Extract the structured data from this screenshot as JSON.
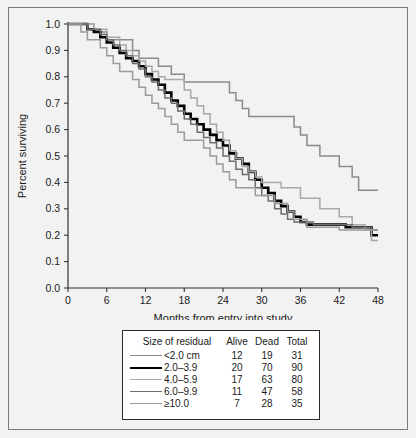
{
  "chart_data": {
    "type": "line",
    "title": "",
    "xlabel": "Months from entry into study",
    "ylabel": "Percent surviving",
    "xlim": [
      0,
      48
    ],
    "ylim": [
      0.0,
      1.0
    ],
    "xticks": [
      0,
      6,
      12,
      18,
      24,
      30,
      36,
      42,
      48
    ],
    "xtick_labels": [
      "0",
      "6",
      "12",
      "18",
      "24",
      "30",
      "36",
      "42",
      "48"
    ],
    "yticks": [
      0.0,
      0.1,
      0.2,
      0.3,
      0.4,
      0.5,
      0.6,
      0.7,
      0.8,
      0.9,
      1.0
    ],
    "ytick_labels": [
      "0.0",
      "0.1",
      "0.2",
      "0.3",
      "0.4",
      "0.5",
      "0.6",
      "0.7",
      "0.8",
      "0.9",
      "1.0"
    ],
    "grid": false,
    "legend_position": "below-plot",
    "step_style": "post",
    "series": [
      {
        "name": "<2.0 cm",
        "color": "#8a8a8a",
        "width": 1.5,
        "points": [
          [
            0,
            1.0
          ],
          [
            2,
            1.0
          ],
          [
            4,
            0.97
          ],
          [
            6,
            0.94
          ],
          [
            8,
            0.94
          ],
          [
            10,
            0.9
          ],
          [
            11,
            0.87
          ],
          [
            13,
            0.87
          ],
          [
            14,
            0.84
          ],
          [
            16,
            0.81
          ],
          [
            17,
            0.81
          ],
          [
            18,
            0.78
          ],
          [
            22,
            0.78
          ],
          [
            24,
            0.78
          ],
          [
            25,
            0.74
          ],
          [
            26,
            0.71
          ],
          [
            27,
            0.68
          ],
          [
            28,
            0.65
          ],
          [
            34,
            0.65
          ],
          [
            35,
            0.61
          ],
          [
            36,
            0.58
          ],
          [
            37,
            0.54
          ],
          [
            38,
            0.54
          ],
          [
            39,
            0.5
          ],
          [
            41,
            0.5
          ],
          [
            42,
            0.46
          ],
          [
            43,
            0.46
          ],
          [
            44,
            0.42
          ],
          [
            45,
            0.37
          ],
          [
            48,
            0.37
          ]
        ]
      },
      {
        "name": "2.0–3.9",
        "color": "#000000",
        "width": 2.6,
        "points": [
          [
            0,
            1.0
          ],
          [
            2,
            1.0
          ],
          [
            3,
            0.98
          ],
          [
            4,
            0.97
          ],
          [
            5,
            0.95
          ],
          [
            6,
            0.93
          ],
          [
            7,
            0.91
          ],
          [
            8,
            0.89
          ],
          [
            9,
            0.87
          ],
          [
            10,
            0.86
          ],
          [
            11,
            0.84
          ],
          [
            12,
            0.81
          ],
          [
            13,
            0.79
          ],
          [
            14,
            0.77
          ],
          [
            15,
            0.74
          ],
          [
            16,
            0.71
          ],
          [
            17,
            0.69
          ],
          [
            18,
            0.66
          ],
          [
            19,
            0.64
          ],
          [
            20,
            0.62
          ],
          [
            21,
            0.6
          ],
          [
            22,
            0.58
          ],
          [
            23,
            0.56
          ],
          [
            24,
            0.54
          ],
          [
            25,
            0.51
          ],
          [
            26,
            0.49
          ],
          [
            27,
            0.47
          ],
          [
            28,
            0.44
          ],
          [
            29,
            0.41
          ],
          [
            30,
            0.38
          ],
          [
            31,
            0.36
          ],
          [
            32,
            0.33
          ],
          [
            33,
            0.31
          ],
          [
            34,
            0.29
          ],
          [
            35,
            0.27
          ],
          [
            36,
            0.25
          ],
          [
            37,
            0.24
          ],
          [
            40,
            0.24
          ],
          [
            43,
            0.23
          ],
          [
            46,
            0.23
          ],
          [
            47,
            0.2
          ],
          [
            48,
            0.2
          ]
        ]
      },
      {
        "name": "4.0–5.9",
        "color": "#a8a8a8",
        "width": 1.5,
        "points": [
          [
            0,
            1.0
          ],
          [
            2,
            1.0
          ],
          [
            4,
            0.98
          ],
          [
            6,
            0.95
          ],
          [
            8,
            0.92
          ],
          [
            9,
            0.9
          ],
          [
            10,
            0.88
          ],
          [
            11,
            0.86
          ],
          [
            12,
            0.84
          ],
          [
            13,
            0.82
          ],
          [
            14,
            0.8
          ],
          [
            15,
            0.79
          ],
          [
            17,
            0.79
          ],
          [
            18,
            0.75
          ],
          [
            19,
            0.72
          ],
          [
            20,
            0.69
          ],
          [
            21,
            0.66
          ],
          [
            22,
            0.62
          ],
          [
            23,
            0.59
          ],
          [
            24,
            0.56
          ],
          [
            25,
            0.52
          ],
          [
            26,
            0.49
          ],
          [
            27,
            0.46
          ],
          [
            28,
            0.44
          ],
          [
            29,
            0.42
          ],
          [
            30,
            0.4
          ],
          [
            32,
            0.4
          ],
          [
            33,
            0.38
          ],
          [
            35,
            0.38
          ],
          [
            36,
            0.34
          ],
          [
            38,
            0.34
          ],
          [
            39,
            0.3
          ],
          [
            41,
            0.3
          ],
          [
            42,
            0.27
          ],
          [
            44,
            0.24
          ],
          [
            46,
            0.22
          ],
          [
            47,
            0.18
          ],
          [
            48,
            0.18
          ]
        ]
      },
      {
        "name": "6.0–9.9",
        "color": "#6e6e6e",
        "width": 1.5,
        "points": [
          [
            0,
            1.0
          ],
          [
            2,
            1.0
          ],
          [
            3,
            0.98
          ],
          [
            5,
            0.96
          ],
          [
            6,
            0.94
          ],
          [
            7,
            0.92
          ],
          [
            8,
            0.9
          ],
          [
            9,
            0.88
          ],
          [
            10,
            0.85
          ],
          [
            11,
            0.83
          ],
          [
            12,
            0.8
          ],
          [
            13,
            0.78
          ],
          [
            14,
            0.75
          ],
          [
            15,
            0.72
          ],
          [
            16,
            0.7
          ],
          [
            17,
            0.67
          ],
          [
            18,
            0.64
          ],
          [
            19,
            0.62
          ],
          [
            20,
            0.59
          ],
          [
            21,
            0.57
          ],
          [
            22,
            0.55
          ],
          [
            23,
            0.53
          ],
          [
            24,
            0.5
          ],
          [
            25,
            0.48
          ],
          [
            26,
            0.45
          ],
          [
            27,
            0.43
          ],
          [
            28,
            0.41
          ],
          [
            29,
            0.38
          ],
          [
            30,
            0.35
          ],
          [
            31,
            0.33
          ],
          [
            32,
            0.3
          ],
          [
            33,
            0.28
          ],
          [
            34,
            0.26
          ],
          [
            35,
            0.25
          ],
          [
            37,
            0.25
          ],
          [
            38,
            0.24
          ],
          [
            42,
            0.24
          ],
          [
            44,
            0.23
          ],
          [
            47,
            0.22
          ],
          [
            48,
            0.22
          ]
        ]
      },
      {
        "name": "≥10.0",
        "color": "#9b9b9b",
        "width": 1.5,
        "points": [
          [
            0,
            1.0
          ],
          [
            1,
            1.0
          ],
          [
            2,
            0.97
          ],
          [
            3,
            0.94
          ],
          [
            5,
            0.91
          ],
          [
            6,
            0.88
          ],
          [
            7,
            0.85
          ],
          [
            8,
            0.82
          ],
          [
            10,
            0.79
          ],
          [
            11,
            0.76
          ],
          [
            12,
            0.73
          ],
          [
            13,
            0.7
          ],
          [
            14,
            0.68
          ],
          [
            15,
            0.65
          ],
          [
            16,
            0.62
          ],
          [
            17,
            0.59
          ],
          [
            18,
            0.56
          ],
          [
            20,
            0.56
          ],
          [
            21,
            0.53
          ],
          [
            22,
            0.5
          ],
          [
            23,
            0.47
          ],
          [
            24,
            0.44
          ],
          [
            25,
            0.41
          ],
          [
            26,
            0.38
          ],
          [
            28,
            0.38
          ],
          [
            29,
            0.35
          ],
          [
            31,
            0.35
          ],
          [
            32,
            0.32
          ],
          [
            34,
            0.29
          ],
          [
            35,
            0.26
          ],
          [
            37,
            0.23
          ],
          [
            41,
            0.23
          ],
          [
            42,
            0.22
          ],
          [
            46,
            0.22
          ],
          [
            48,
            0.22
          ]
        ]
      }
    ]
  },
  "axes": {
    "x_title": "Months from entry into study",
    "y_title": "Percent surviving"
  },
  "legend": {
    "headers": {
      "label": "Size of residual",
      "alive": "Alive",
      "dead": "Dead",
      "total": "Total"
    },
    "rows": [
      {
        "label": "<2.0 cm",
        "alive": "12",
        "dead": "19",
        "total": "31",
        "color": "#8a8a8a",
        "width": "1.6px"
      },
      {
        "label": "2.0–3.9",
        "alive": "20",
        "dead": "70",
        "total": "90",
        "color": "#000000",
        "width": "2.8px"
      },
      {
        "label": "4.0–5.9",
        "alive": "17",
        "dead": "63",
        "total": "80",
        "color": "#a8a8a8",
        "width": "1.6px"
      },
      {
        "label": "6.0–9.9",
        "alive": "11",
        "dead": "47",
        "total": "58",
        "color": "#6e6e6e",
        "width": "1.6px"
      },
      {
        "label": "≥10.0",
        "alive": "7",
        "dead": "28",
        "total": "35",
        "color": "#9b9b9b",
        "width": "1.6px"
      }
    ]
  }
}
